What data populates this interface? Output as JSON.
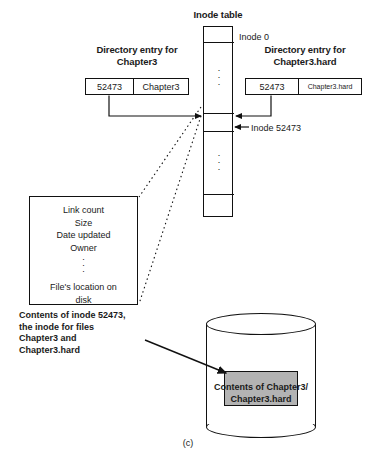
{
  "figure": {
    "caption": "(c)",
    "inode_table_title": "Inode table",
    "inode_zero_label": "Inode 0",
    "inode_52473_label": "Inode 52473",
    "left_entry_title_line1": "Directory entry for",
    "left_entry_title_line2": "Chapter3",
    "right_entry_title_line1": "Directory entry for",
    "right_entry_title_line2": "Chapter3.hard",
    "left_entry": {
      "inode_number": "52473",
      "name": "Chapter3"
    },
    "right_entry": {
      "inode_number": "52473",
      "name": "Chapter3.hard"
    },
    "inode_contents": {
      "lines": [
        "Link count",
        "Size",
        "Date updated",
        "Owner"
      ],
      "dots": "·\n·\n·",
      "last_line": "File's location on",
      "last_line2": "disk"
    },
    "inode_caption_line1": "Contents of inode 52473,",
    "inode_caption_line2": "the inode for files",
    "inode_caption_line3": "Chapter3 and",
    "inode_caption_line4": "Chapter3.hard",
    "disk_caption_line1": "Contents of Chapter3/",
    "disk_caption_line2": "Chapter3.hard",
    "table_dots": "·",
    "colors": {
      "stroke": "#111111",
      "block_fill": "#b3b3b3",
      "background": "#ffffff"
    }
  }
}
